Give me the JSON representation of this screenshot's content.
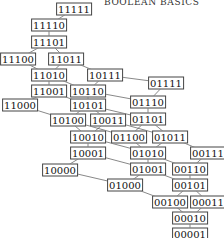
{
  "header": {
    "title": "BOOLEAN BASICS"
  },
  "nodes": [
    {
      "id": "11111",
      "x": 74,
      "y": 9
    },
    {
      "id": "11110",
      "x": 49,
      "y": 25
    },
    {
      "id": "11101",
      "x": 49,
      "y": 42
    },
    {
      "id": "11100",
      "x": 18,
      "y": 59
    },
    {
      "id": "11011",
      "x": 66,
      "y": 59
    },
    {
      "id": "11010",
      "x": 49,
      "y": 75
    },
    {
      "id": "10111",
      "x": 105,
      "y": 75
    },
    {
      "id": "01111",
      "x": 166,
      "y": 83
    },
    {
      "id": "11001",
      "x": 49,
      "y": 91
    },
    {
      "id": "10110",
      "x": 88,
      "y": 91
    },
    {
      "id": "11000",
      "x": 20,
      "y": 105
    },
    {
      "id": "10101",
      "x": 88,
      "y": 105
    },
    {
      "id": "01110",
      "x": 148,
      "y": 102
    },
    {
      "id": "10100",
      "x": 68,
      "y": 120
    },
    {
      "id": "10011",
      "x": 108,
      "y": 120
    },
    {
      "id": "01101",
      "x": 148,
      "y": 119
    },
    {
      "id": "10010",
      "x": 88,
      "y": 137
    },
    {
      "id": "01100",
      "x": 129,
      "y": 137
    },
    {
      "id": "01011",
      "x": 170,
      "y": 137
    },
    {
      "id": "10001",
      "x": 88,
      "y": 153
    },
    {
      "id": "01010",
      "x": 148,
      "y": 153
    },
    {
      "id": "00111",
      "x": 208,
      "y": 153
    },
    {
      "id": "10000",
      "x": 60,
      "y": 170
    },
    {
      "id": "01001",
      "x": 148,
      "y": 169
    },
    {
      "id": "00110",
      "x": 190,
      "y": 169
    },
    {
      "id": "01000",
      "x": 125,
      "y": 185
    },
    {
      "id": "00101",
      "x": 190,
      "y": 185
    },
    {
      "id": "00100",
      "x": 170,
      "y": 202
    },
    {
      "id": "00011",
      "x": 208,
      "y": 202
    },
    {
      "id": "00010",
      "x": 190,
      "y": 218
    },
    {
      "id": "00001",
      "x": 190,
      "y": 234
    }
  ],
  "edges": [
    [
      "11111",
      "11110"
    ],
    [
      "11110",
      "11101"
    ],
    [
      "11101",
      "11100"
    ],
    [
      "11101",
      "11011"
    ],
    [
      "11100",
      "11010"
    ],
    [
      "11011",
      "11010"
    ],
    [
      "11011",
      "10111"
    ],
    [
      "11010",
      "11001"
    ],
    [
      "11010",
      "10110"
    ],
    [
      "10111",
      "10110"
    ],
    [
      "10111",
      "01111"
    ],
    [
      "11001",
      "11000"
    ],
    [
      "11001",
      "10101"
    ],
    [
      "10110",
      "10101"
    ],
    [
      "10110",
      "01110"
    ],
    [
      "01111",
      "01110"
    ],
    [
      "11000",
      "10100"
    ],
    [
      "10101",
      "10100"
    ],
    [
      "10101",
      "10011"
    ],
    [
      "10101",
      "01101"
    ],
    [
      "01110",
      "01101"
    ],
    [
      "10100",
      "10010"
    ],
    [
      "10100",
      "01100"
    ],
    [
      "10011",
      "10010"
    ],
    [
      "10011",
      "01011"
    ],
    [
      "01101",
      "01100"
    ],
    [
      "01101",
      "01011"
    ],
    [
      "10010",
      "10001"
    ],
    [
      "10010",
      "01010"
    ],
    [
      "01100",
      "01010"
    ],
    [
      "01011",
      "01010"
    ],
    [
      "01011",
      "00111"
    ],
    [
      "10001",
      "10000"
    ],
    [
      "10001",
      "01001"
    ],
    [
      "01010",
      "01001"
    ],
    [
      "01010",
      "00110"
    ],
    [
      "00111",
      "00110"
    ],
    [
      "10000",
      "01000"
    ],
    [
      "01001",
      "01000"
    ],
    [
      "01001",
      "00101"
    ],
    [
      "00110",
      "00101"
    ],
    [
      "01000",
      "00100"
    ],
    [
      "00101",
      "00100"
    ],
    [
      "00101",
      "00011"
    ],
    [
      "00100",
      "00010"
    ],
    [
      "00011",
      "00010"
    ],
    [
      "00010",
      "00001"
    ]
  ]
}
